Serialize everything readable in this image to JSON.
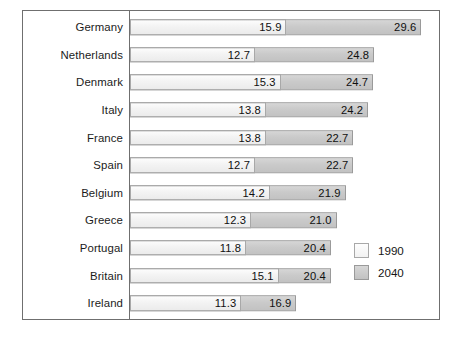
{
  "chart_data": {
    "type": "bar",
    "orientation": "horizontal",
    "title": "",
    "subtitle": "",
    "xlabel": "",
    "ylabel": "",
    "grid": false,
    "xlim": [
      0,
      31.5
    ],
    "legend_position": "bottom-right",
    "categories": [
      "Germany",
      "Netherlands",
      "Denmark",
      "Italy",
      "France",
      "Spain",
      "Belgium",
      "Greece",
      "Portugal",
      "Britain",
      "Ireland"
    ],
    "series": [
      {
        "name": "1990",
        "color": "#f2f2f2",
        "values": [
          15.9,
          12.7,
          15.3,
          13.8,
          13.8,
          12.7,
          14.2,
          12.3,
          11.8,
          15.1,
          11.3
        ]
      },
      {
        "name": "2040",
        "color": "#c8c8c8",
        "values": [
          29.6,
          24.8,
          24.7,
          24.2,
          22.7,
          22.7,
          21.9,
          21.0,
          20.4,
          20.4,
          16.9
        ]
      }
    ],
    "value_labels": {
      "1990": [
        "15.9",
        "12.7",
        "15.3",
        "13.8",
        "13.8",
        "12.7",
        "14.2",
        "12.3",
        "11.8",
        "15.1",
        "11.3"
      ],
      "2040": [
        "29.6",
        "24.8",
        "24.7",
        "24.2",
        "22.7",
        "22.7",
        "21.9",
        "21.0",
        "20.4",
        "20.4",
        "16.9"
      ]
    }
  },
  "legend": {
    "items": [
      {
        "label": "1990",
        "swatch": "light-gray-swatch"
      },
      {
        "label": "2040",
        "swatch": "dark-gray-swatch"
      }
    ]
  }
}
